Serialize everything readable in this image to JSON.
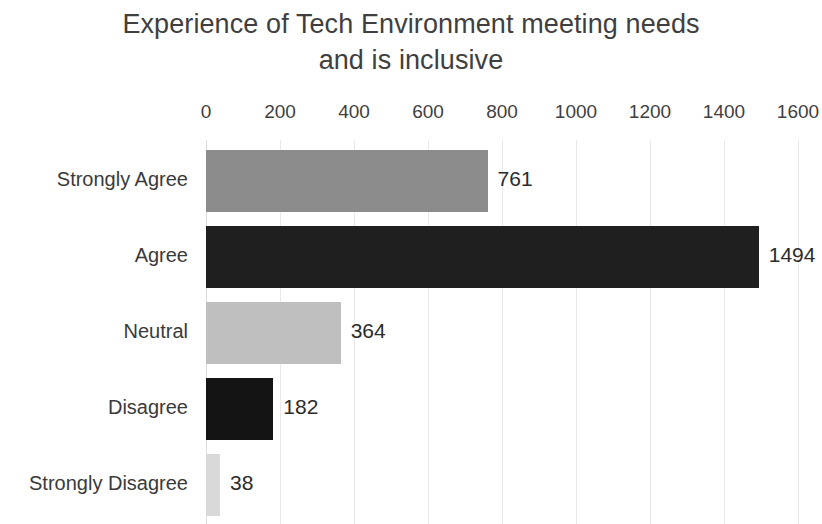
{
  "chart_data": {
    "type": "bar",
    "orientation": "horizontal",
    "title": "Experience of Tech Environment meeting needs and is inclusive",
    "title_line1": "Experience of Tech Environment meeting needs",
    "title_line2": "and is inclusive",
    "xlabel": "",
    "ylabel": "",
    "categories": [
      "Strongly Agree",
      "Agree",
      "Neutral",
      "Disagree",
      "Strongly Disagree"
    ],
    "values": [
      761,
      1494,
      364,
      182,
      38
    ],
    "bar_colors": [
      "#8c8c8c",
      "#1f1f1f",
      "#bfbfbf",
      "#141414",
      "#d9d9d9"
    ],
    "data_labels": [
      "761",
      "1494",
      "364",
      "182",
      "38"
    ],
    "xlim": [
      0,
      1600
    ],
    "xticks": [
      0,
      200,
      400,
      600,
      800,
      1000,
      1200,
      1400,
      1600
    ],
    "xtick_labels": [
      "0",
      "200",
      "400",
      "600",
      "800",
      "1000",
      "1200",
      "1400",
      "1600"
    ],
    "grid": true,
    "grid_axis": "x",
    "grid_color": "#e9e9e9",
    "legend": false,
    "background": "#ffffff",
    "text_color": "#3a3a3a"
  }
}
